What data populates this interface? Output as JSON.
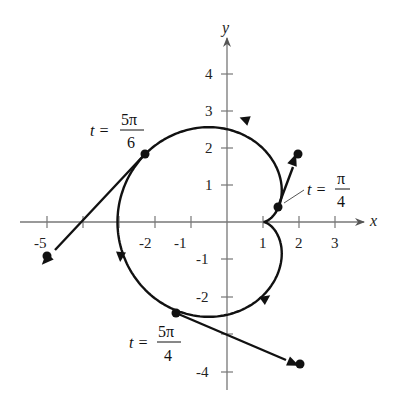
{
  "figure": {
    "type": "parametric-curve-plot",
    "curve": "cardioid with cusp at (1, 0), traversed counterclockwise",
    "axes": {
      "x_label": "x",
      "y_label": "y",
      "x_ticks": [
        "-5",
        "-2",
        "-1",
        "1",
        "2",
        "3"
      ],
      "x_tick_values": [
        -5,
        -4,
        -3,
        -2,
        -1,
        1,
        2,
        3
      ],
      "y_ticks": [
        "4",
        "3",
        "2",
        "1",
        "-1",
        "-2",
        "-4"
      ],
      "y_tick_values": [
        4,
        3,
        2,
        1,
        -1,
        -2,
        -3,
        -4
      ]
    },
    "points": [
      {
        "label_t": "t =",
        "label_num": "5π",
        "label_den": "6",
        "x": -2.23,
        "y": 1.87,
        "tangent_end": [
          -5,
          -0.9
        ]
      },
      {
        "label_t": "t =",
        "label_num": "5π",
        "label_den": "4",
        "x": -1.41,
        "y": -2.41,
        "tangent_end": [
          2,
          -3.9
        ]
      },
      {
        "label_t": "t =",
        "label_num": "π",
        "label_den": "4",
        "x": 1.41,
        "y": 0.41,
        "tangent_end": [
          2,
          1.85
        ]
      }
    ]
  }
}
